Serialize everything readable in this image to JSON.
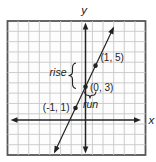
{
  "figure": {
    "background": "#ffffff",
    "ink_color": "#222222",
    "grid_color": "#c7c7c7",
    "border_color": "#565656",
    "axis_labels": {
      "x": "x",
      "y": "y"
    },
    "annotations": {
      "rise": "rise",
      "run": "run"
    }
  },
  "chart_data": {
    "type": "line",
    "title": "",
    "x_axis_label": "x",
    "y_axis_label": "y",
    "grid": true,
    "points": [
      {
        "x": -1,
        "y": 1,
        "label": "(-1, 1)"
      },
      {
        "x": 0,
        "y": 3,
        "label": "(0, 3)"
      },
      {
        "x": 1,
        "y": 5,
        "label": "(1, 5)"
      }
    ],
    "line": {
      "slope": 2,
      "y_intercept": 3
    },
    "rise_annotation": {
      "text": "rise",
      "from_y": 3,
      "to_y": 5
    },
    "run_annotation": {
      "text": "run",
      "from_x": 0,
      "to_x": 1
    }
  }
}
